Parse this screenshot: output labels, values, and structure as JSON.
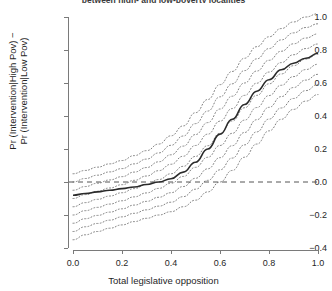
{
  "figure": {
    "title": "between high- and low-poverty localities",
    "background": "#ffffff"
  },
  "axes": {
    "x_label": "Total legislative opposition",
    "y_label_line1": "Pr (Intervention|High Pov) −",
    "y_label_line2": "Pr (Intervention|Low Pov)",
    "x_ticks": [
      "0.0",
      "0.2",
      "0.4",
      "0.6",
      "0.8",
      "1.0"
    ],
    "y_ticks": [
      "1.0",
      "0.8",
      "0.6",
      "0.4",
      "0.2",
      "0.0",
      "−0.2",
      "−0.4"
    ]
  },
  "chart_data": {
    "type": "line",
    "title": "between high- and low-poverty localities",
    "xlabel": "Total legislative opposition",
    "ylabel": "Pr (Intervention|High Pov) − Pr (Intervention|Low Pov)",
    "xlim": [
      0.0,
      1.0
    ],
    "ylim": [
      -0.4,
      1.0
    ],
    "grid": false,
    "legend": "none",
    "x": [
      0.0,
      0.05,
      0.1,
      0.15,
      0.2,
      0.25,
      0.3,
      0.35,
      0.4,
      0.45,
      0.5,
      0.55,
      0.6,
      0.65,
      0.7,
      0.75,
      0.8,
      0.85,
      0.9,
      0.95,
      1.0
    ],
    "series": [
      {
        "name": "Estimated difference in predicted probability",
        "style": "solid",
        "color": "#2b2b2b",
        "values": [
          -0.08,
          -0.07,
          -0.06,
          -0.05,
          -0.04,
          -0.03,
          -0.015,
          0.0,
          0.02,
          0.06,
          0.12,
          0.2,
          0.29,
          0.38,
          0.47,
          0.55,
          0.62,
          0.68,
          0.72,
          0.75,
          0.78
        ]
      },
      {
        "name": "Upper confidence bound",
        "style": "dotted",
        "color": "#7f7f7f",
        "values": [
          0.05,
          0.07,
          0.09,
          0.11,
          0.13,
          0.16,
          0.19,
          0.23,
          0.28,
          0.34,
          0.42,
          0.5,
          0.59,
          0.67,
          0.75,
          0.82,
          0.88,
          0.93,
          0.97,
          1.0,
          1.02
        ]
      },
      {
        "name": "Lower confidence bound",
        "style": "dotted",
        "color": "#7f7f7f",
        "values": [
          -0.35,
          -0.32,
          -0.3,
          -0.28,
          -0.26,
          -0.24,
          -0.22,
          -0.2,
          -0.18,
          -0.15,
          -0.11,
          -0.06,
          0.0,
          0.07,
          0.15,
          0.23,
          0.31,
          0.38,
          0.44,
          0.49,
          0.53
        ]
      }
    ],
    "band_contour_count": 9,
    "reference_lines": [
      {
        "name": "zero-line",
        "orientation": "horizontal",
        "value": 0.0,
        "style": "dashed",
        "color": "#555555"
      }
    ]
  }
}
